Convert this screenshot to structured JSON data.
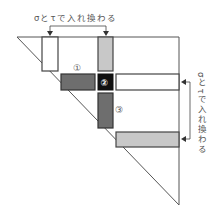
{
  "top_annotation": {
    "text": "σとτで入れ換わる"
  },
  "right_annotation": {
    "text": "σとτで入れ換わる"
  },
  "markers": {
    "block_1": "①",
    "block_2": "②",
    "block_3": "③"
  },
  "colors": {
    "line": "#555555",
    "dark_block": "#6e6e6e",
    "light_block": "#c8c8c8",
    "pivot_block": "#111111",
    "white_block": "#ffffff"
  }
}
